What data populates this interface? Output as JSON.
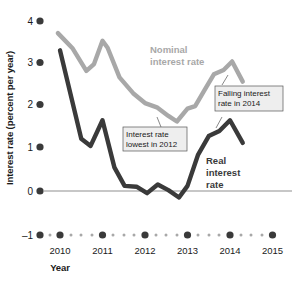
{
  "chart_data": {
    "type": "line",
    "title": "",
    "xlabel": "Year",
    "ylabel": "Interest rate (percent per year)",
    "xlim": [
      2009.6,
      2015.3
    ],
    "ylim": [
      -1,
      4
    ],
    "yticks": [
      -1,
      0,
      1,
      2,
      3,
      4
    ],
    "ytick_labels": [
      "–1",
      "0",
      "1",
      "2",
      "3",
      "4"
    ],
    "xticks": [
      2010,
      2011,
      2012,
      2013,
      2014,
      2015
    ],
    "xtick_labels": [
      "2010",
      "2011",
      "2012",
      "2013",
      "2014",
      "2015"
    ],
    "grid": false,
    "legend": "inline-labels",
    "series": [
      {
        "name": "Nominal interest rate",
        "color": "#a8a8a8",
        "x": [
          2009.95,
          2010.3,
          2010.62,
          2010.8,
          2011.0,
          2011.12,
          2011.4,
          2011.72,
          2012.0,
          2012.28,
          2012.55,
          2012.75,
          2013.0,
          2013.18,
          2013.4,
          2013.62,
          2013.85,
          2014.05,
          2014.3
        ],
        "y": [
          3.68,
          3.32,
          2.8,
          2.96,
          3.5,
          3.34,
          2.65,
          2.28,
          2.05,
          1.95,
          1.75,
          1.62,
          1.92,
          1.98,
          2.35,
          2.72,
          2.82,
          3.02,
          2.55
        ]
      },
      {
        "name": "Real interest rate",
        "color": "#3a3a3a",
        "x": [
          2010.0,
          2010.5,
          2010.72,
          2011.0,
          2011.28,
          2011.52,
          2011.8,
          2012.05,
          2012.3,
          2012.55,
          2012.8,
          2013.0,
          2013.25,
          2013.5,
          2013.75,
          2014.0,
          2014.3
        ],
        "y": [
          3.28,
          1.22,
          1.05,
          1.65,
          0.55,
          0.12,
          0.1,
          -0.05,
          0.15,
          0.02,
          -0.15,
          0.12,
          0.85,
          1.28,
          1.4,
          1.65,
          1.12
        ]
      }
    ],
    "series_labels": [
      {
        "name": "nominal-series-label",
        "lines": [
          "Nominal",
          "interest rate"
        ],
        "color": "#a8a8a8"
      },
      {
        "name": "real-series-label",
        "lines": [
          "Real",
          "interest",
          "rate"
        ],
        "color": "#3a3a3a"
      }
    ],
    "annotations": [
      {
        "name": "lowest-2012-annotation",
        "lines": [
          "Interest rate",
          "lowest in 2012"
        ]
      },
      {
        "name": "falling-2014-annotation",
        "lines": [
          "Falling interest",
          "rate in 2014"
        ]
      }
    ]
  }
}
